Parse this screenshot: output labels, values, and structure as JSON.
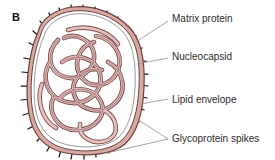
{
  "figure": {
    "panel_label": "B",
    "background_color": "#ffffff"
  },
  "colors": {
    "envelope_fill": "#d9a9a4",
    "envelope_fill_light": "#e8c4c0",
    "envelope_outline": "#6b3f3c",
    "inner_membrane_line": "#9a9a9a",
    "nucleocapsid_fill": "#e3c2c0",
    "nucleocapsid_outline": "#7d4b49",
    "spike_color": "#111111",
    "leader_line_color": "#8d8d8d",
    "text_color": "#2b2b2b",
    "interior_fill": "#ffffff"
  },
  "labels": [
    {
      "id": "matrix-protein",
      "text": "Matrix protein",
      "x": 172,
      "y": 13,
      "leader_from": [
        168,
        22
      ],
      "leader_to": [
        139,
        40
      ]
    },
    {
      "id": "nucleocapsid",
      "text": "Nucleocapsid",
      "x": 172,
      "y": 51,
      "leader_from": [
        168,
        59
      ],
      "leader_to": [
        137,
        65
      ]
    },
    {
      "id": "lipid-envelope",
      "text": "Lipid envelope",
      "x": 172,
      "y": 94,
      "leader_from": [
        168,
        100
      ],
      "leader_to": [
        140,
        104
      ]
    },
    {
      "id": "glycoprotein-spikes",
      "text": "Glycoprotein spikes",
      "x": 172,
      "y": 133,
      "leader_from": [
        168,
        140
      ],
      "leader_to_upper": [
        138,
        118
      ],
      "leader_to_lower": [
        108,
        153
      ]
    }
  ],
  "structures": {
    "glycoprotein_spike_count": 30,
    "spike_length_px": 9,
    "envelope_thickness_px": 5,
    "nucleocapsid_description": "coiled helical nucleocapsid tube, tangled"
  }
}
